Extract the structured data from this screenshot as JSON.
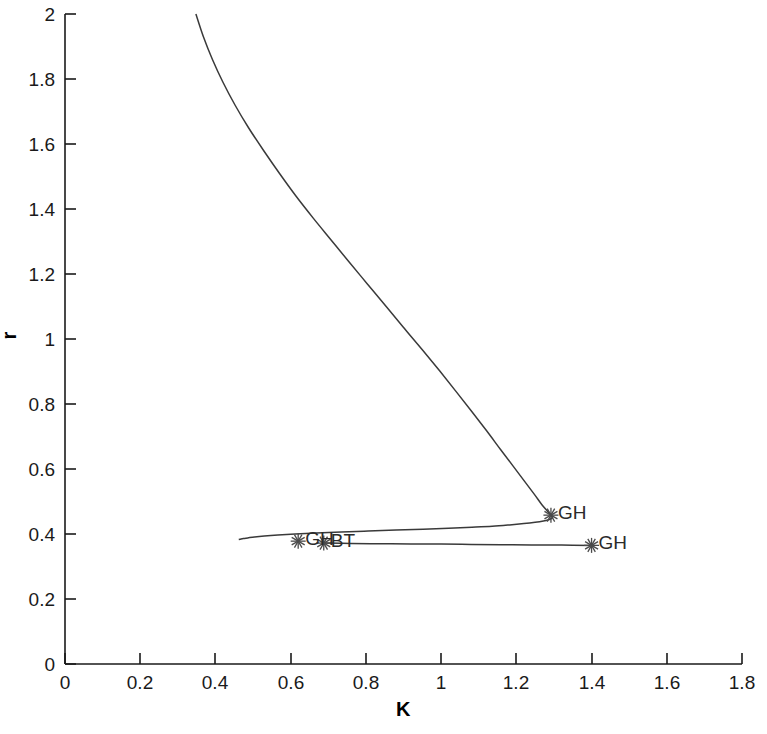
{
  "figure": {
    "background": "#ffffff",
    "curve_color": "#3a3a3a",
    "axis_color": "#1a1a1a",
    "marker_color": "#4a4a4a"
  },
  "chart_data": {
    "type": "line",
    "title": "",
    "xlabel": "K",
    "ylabel": "r",
    "xlim": [
      0,
      1.8
    ],
    "ylim": [
      0,
      2
    ],
    "xticks": [
      0,
      0.2,
      0.4,
      0.6,
      0.8,
      1,
      1.2,
      1.4,
      1.6,
      1.8
    ],
    "xticklabels": [
      "0",
      "0.2",
      "0.4",
      "0.6",
      "0.8",
      "1",
      "1.2",
      "1.4",
      "1.6",
      "1.8"
    ],
    "yticks": [
      0,
      0.2,
      0.4,
      0.6,
      0.8,
      1,
      1.2,
      1.4,
      1.6,
      1.8,
      2
    ],
    "yticklabels": [
      "0",
      "0.2",
      "0.4",
      "0.6",
      "0.8",
      "1",
      "1.2",
      "1.4",
      "1.6",
      "1.8",
      "2"
    ],
    "grid": false,
    "legend": false,
    "series": [
      {
        "name": "hopf-curve-upper",
        "comment": "Descending fold branch from top-left to turning point, then back left to terminus",
        "x": [
          0.348,
          0.368,
          0.392,
          0.42,
          0.452,
          0.488,
          0.528,
          0.57,
          0.614,
          0.66,
          0.708,
          0.756,
          0.805,
          0.854,
          0.902,
          0.95,
          0.996,
          1.04,
          1.082,
          1.122,
          1.158,
          1.192,
          1.222,
          1.248,
          1.268,
          1.283,
          1.292,
          1.296,
          1.294,
          1.286,
          1.272,
          1.25,
          1.22,
          1.182,
          1.136,
          1.082,
          1.02,
          0.952,
          0.88,
          0.806,
          0.734,
          0.668,
          0.612,
          0.566,
          0.53,
          0.504,
          0.486,
          0.474,
          0.466,
          0.462
        ],
        "y": [
          2.0,
          1.93,
          1.86,
          1.79,
          1.72,
          1.65,
          1.58,
          1.51,
          1.44,
          1.372,
          1.304,
          1.236,
          1.168,
          1.1,
          1.033,
          0.967,
          0.902,
          0.838,
          0.776,
          0.716,
          0.66,
          0.608,
          0.562,
          0.522,
          0.49,
          0.47,
          0.458,
          0.452,
          0.448,
          0.444,
          0.44,
          0.436,
          0.432,
          0.428,
          0.424,
          0.421,
          0.418,
          0.415,
          0.412,
          0.409,
          0.406,
          0.403,
          0.4,
          0.397,
          0.394,
          0.391,
          0.388,
          0.386,
          0.384,
          0.383
        ]
      },
      {
        "name": "hopf-curve-lower",
        "comment": "Nearly horizontal branch from left terminus to right GH point",
        "x": [
          0.688,
          0.76,
          0.84,
          0.92,
          1.0,
          1.08,
          1.16,
          1.24,
          1.32,
          1.4
        ],
        "y": [
          0.372,
          0.371,
          0.37,
          0.369,
          0.369,
          0.368,
          0.367,
          0.366,
          0.366,
          0.365
        ]
      }
    ],
    "special_points": [
      {
        "label": "GH",
        "x": 1.292,
        "y": 0.458,
        "marker": "asterisk",
        "label_side": "right"
      },
      {
        "label": "GH",
        "x": 1.4,
        "y": 0.365,
        "marker": "asterisk",
        "label_side": "right"
      },
      {
        "label": "GH",
        "x": 0.62,
        "y": 0.378,
        "marker": "asterisk",
        "label_side": "right"
      },
      {
        "label": "BT",
        "x": 0.688,
        "y": 0.372,
        "marker": "asterisk",
        "label_side": "right"
      }
    ]
  }
}
